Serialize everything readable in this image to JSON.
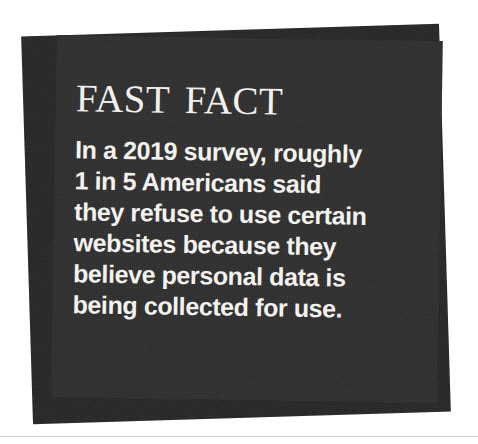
{
  "callout": {
    "kind": "fast-fact-callout",
    "title": "Fast Fact",
    "body_lines": [
      "In a 2019 survey, roughly",
      "1 in 5 Americans said",
      "they refuse to use certain",
      "websites because they",
      "believe personal data is",
      "being collected for use."
    ],
    "body_text": "In a 2019 survey, roughly 1 in 5 Americans said they refuse to use certain websites because they believe personal data is being collected for use.",
    "colors": {
      "card_front": "#2f2f2f",
      "card_back": "#272727",
      "text": "#f4f2ef",
      "page_background": "#ffffff",
      "page_rule": "#d2d2d2"
    }
  }
}
